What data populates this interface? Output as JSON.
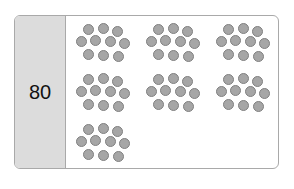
{
  "card": {
    "number_label": "80",
    "group_size": 10,
    "group_count": 8,
    "layout_rows": [
      3,
      3,
      1
    ],
    "cluster_pattern_rows": [
      3,
      4,
      3
    ],
    "colors": {
      "label_panel_bg": "#dcdcdc",
      "border": "#a9a9a9",
      "dot_fill": "#a6a6a6",
      "dot_stroke": "#808080"
    }
  }
}
